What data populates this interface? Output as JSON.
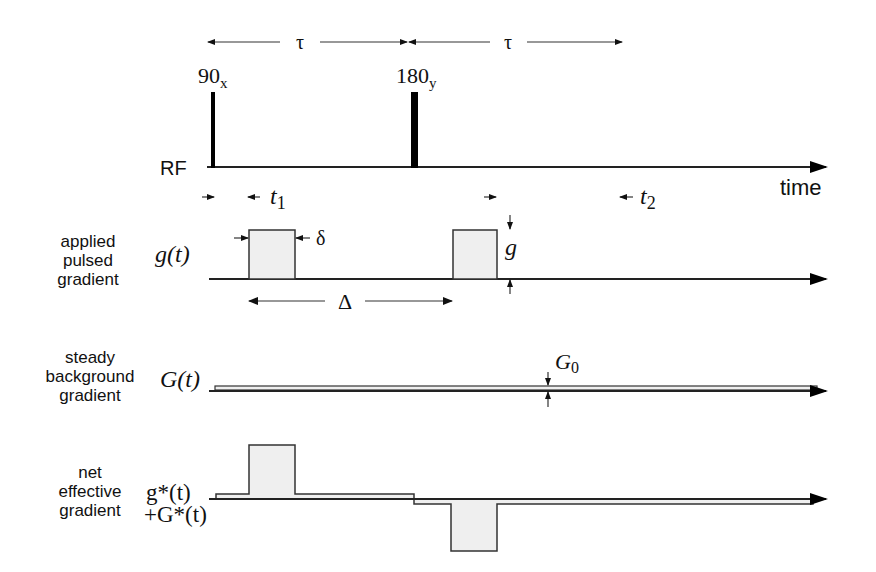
{
  "diagram": {
    "timing": {
      "tau_left": "τ",
      "tau_right": "τ",
      "pulse_90_main": "90",
      "pulse_90_sub": "x",
      "pulse_180_main": "180",
      "pulse_180_sub": "y",
      "t1_main": "t",
      "t1_sub": "1",
      "t2_main": "t",
      "t2_sub": "2",
      "time_label": "time"
    },
    "rows": [
      {
        "id": "rf",
        "label_lines": [
          "RF"
        ],
        "symbol": ""
      },
      {
        "id": "applied",
        "label_lines": [
          "applied",
          "pulsed",
          "gradient"
        ],
        "symbol": "g(t)",
        "annotations": {
          "delta_small": "δ",
          "delta_big": "Δ",
          "amplitude": "g"
        }
      },
      {
        "id": "background",
        "label_lines": [
          "steady",
          "background",
          "gradient"
        ],
        "symbol": "G(t)",
        "annotations": {
          "amplitude_main": "G",
          "amplitude_sub": "0"
        }
      },
      {
        "id": "net",
        "label_lines": [
          "net",
          "effective",
          "gradient"
        ],
        "symbol_line1": "g*(t)",
        "symbol_line2": "+G*(t)"
      }
    ],
    "colors": {
      "line": "#222222",
      "pulse_fill": "#efefef",
      "rf_pulse": "#000000"
    }
  }
}
